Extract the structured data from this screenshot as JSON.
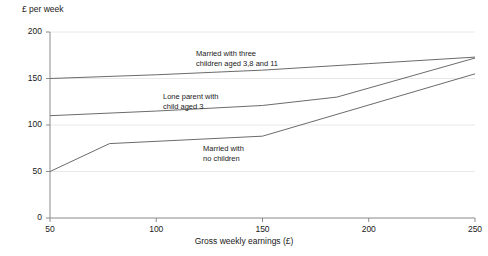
{
  "chart_data": {
    "type": "line",
    "title": "",
    "ylabel": "£ per week",
    "xlabel": "Gross weekly earnings (£)",
    "xlim": [
      50,
      250
    ],
    "ylim": [
      0,
      200
    ],
    "xticks": [
      50,
      100,
      150,
      200,
      250
    ],
    "xtick_labels": [
      "50",
      "100",
      "150",
      "200",
      "250"
    ],
    "yticks": [
      0,
      50,
      100,
      150,
      200
    ],
    "ytick_labels": [
      "0",
      "50",
      "100",
      "150",
      "200"
    ],
    "grid": "horizontal",
    "legend_position": "inline-annotations",
    "series": [
      {
        "name": "Married with three children aged 3,8 and 11",
        "label_line1": "Married with three",
        "label_line2": "children aged 3,8 and 11",
        "color": "#6b6b6b",
        "x": [
          50,
          100,
          150,
          200,
          250
        ],
        "y": [
          150,
          154,
          159,
          166,
          173
        ]
      },
      {
        "name": "Lone parent with child aged 3",
        "label_line1": "Lone parent with",
        "label_line2": "child aged 3",
        "color": "#6b6b6b",
        "x": [
          50,
          100,
          150,
          185,
          250
        ],
        "y": [
          110,
          115,
          121,
          130,
          172
        ]
      },
      {
        "name": "Married with no children",
        "label_line1": "Married  with",
        "label_line2": "no children",
        "color": "#6b6b6b",
        "x": [
          50,
          78,
          150,
          250
        ],
        "y": [
          50,
          80,
          88,
          155
        ]
      }
    ]
  },
  "annotations": {
    "series0_label_x": 196,
    "series0_label_y": 49,
    "series1_label_x": 163,
    "series1_label_y": 92,
    "series2_label_x": 203,
    "series2_label_y": 144
  },
  "axis_colors": {
    "axis_line": "#8a8a8a",
    "grid_line": "#e8e8e8",
    "series_line": "#6b6b6b"
  }
}
